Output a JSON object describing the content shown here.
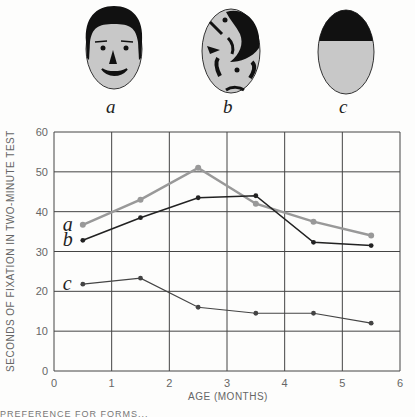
{
  "faces": [
    {
      "id": "a",
      "label": "a",
      "description": "schematic face with features"
    },
    {
      "id": "b",
      "label": "b",
      "description": "scrambled features"
    },
    {
      "id": "c",
      "label": "c",
      "description": "plain oval with dark top"
    }
  ],
  "chart_data": {
    "type": "line",
    "title": "",
    "xlabel": "AGE (MONTHS)",
    "ylabel": "SECONDS OF FIXATION IN TWO-MINUTE TEST",
    "xlim": [
      0,
      6
    ],
    "ylim": [
      0,
      60
    ],
    "x_ticks": [
      "0",
      "1",
      "2",
      "3",
      "4",
      "5",
      "6"
    ],
    "y_ticks": [
      "0",
      "10",
      "20",
      "30",
      "40",
      "50",
      "60"
    ],
    "grid": true,
    "legend": "inline labels at left of each series",
    "x": [
      0.5,
      1.5,
      2.5,
      3.5,
      4.5,
      5.5
    ],
    "series": [
      {
        "name": "a",
        "color": "#999999",
        "values": [
          36.7,
          43,
          51,
          42,
          37.5,
          34
        ]
      },
      {
        "name": "b",
        "color": "#222222",
        "values": [
          32.8,
          38.5,
          43.5,
          44,
          32.3,
          31.5
        ]
      },
      {
        "name": "c",
        "color": "#444444",
        "values": [
          21.8,
          23.3,
          16,
          14.5,
          14.5,
          12
        ]
      }
    ]
  },
  "footer": {
    "truncated_text": "PREFERENCE FOR FORMS..."
  }
}
